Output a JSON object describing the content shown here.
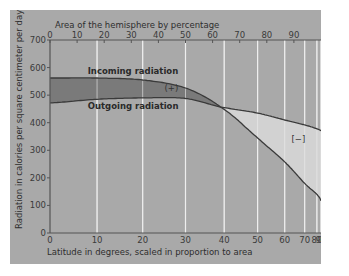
{
  "chart_data": {
    "type": "area",
    "title": "",
    "top_axis_title": "Area of the hemisphere by percentage",
    "xlabel": "Latitude in degrees, scaled in proportion to area",
    "ylabel": "Radiation in calories per square centimeter per day",
    "xlim": [
      0,
      90
    ],
    "x_scale": "sine (proportional to area)",
    "ylim": [
      0,
      700
    ],
    "grid": "vertical",
    "x_ticks": [
      0,
      10,
      20,
      30,
      40,
      50,
      60,
      70,
      80,
      90
    ],
    "x_tick_labels": [
      "0",
      "10",
      "20",
      "30",
      "40",
      "50",
      "60",
      "70",
      "80",
      "90"
    ],
    "top_ticks": [
      0,
      10,
      20,
      30,
      40,
      50,
      60,
      70,
      80,
      90
    ],
    "top_tick_labels": [
      "0",
      "10",
      "20",
      "30",
      "40",
      "50",
      "60",
      "70",
      "80",
      "90"
    ],
    "y_ticks": [
      0,
      100,
      200,
      300,
      400,
      500,
      600,
      700
    ],
    "y_tick_labels": [
      "0",
      "100",
      "200",
      "300",
      "400",
      "500",
      "600",
      "700"
    ],
    "x": [
      0,
      10,
      20,
      30,
      39,
      50,
      60,
      70,
      80,
      90
    ],
    "series": [
      {
        "name": "Incoming radiation",
        "values": [
          562,
          562,
          555,
          526,
          457,
          345,
          258,
          180,
          140,
          116
        ]
      },
      {
        "name": "Outgoing radiation",
        "values": [
          472,
          485,
          490,
          488,
          457,
          435,
          410,
          392,
          378,
          370
        ]
      }
    ],
    "annotations": [
      {
        "text": "(+)",
        "meaning": "surplus: incoming exceeds outgoing",
        "x": 25,
        "y": 515
      },
      {
        "text": "[−]",
        "meaning": "deficit: outgoing exceeds incoming",
        "x": 63,
        "y": 330
      }
    ],
    "colors": {
      "background": "#a9a9a9",
      "surplus_fill": "#7a7a7a",
      "deficit_fill": "#d2d2d2",
      "gridline": "#eeeeee",
      "line": "#3a3a3a"
    }
  }
}
